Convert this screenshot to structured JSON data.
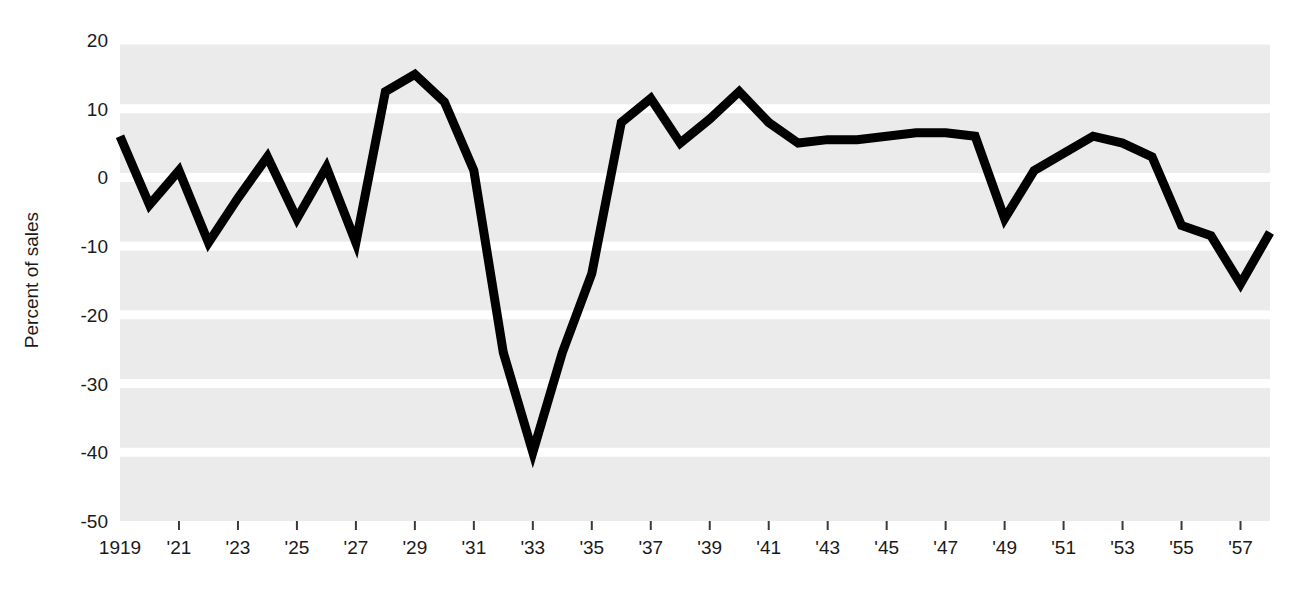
{
  "chart_data": {
    "type": "line",
    "title": "",
    "subtitle": "",
    "xlabel": "",
    "ylabel": "Percent of sales",
    "xlim": [
      1919,
      1958
    ],
    "ylim": [
      -50,
      20
    ],
    "grid": true,
    "legend": false,
    "legend_position": "none",
    "line_color": "#000000",
    "plot_background": "#ebebeb",
    "gridline_color": "#ffffff",
    "y_ticks": [
      20,
      10,
      0,
      -10,
      -20,
      -30,
      -40,
      -50
    ],
    "y_tick_labels": [
      "20",
      "10",
      "0",
      "-10",
      "-20",
      "-30",
      "-40",
      "-50"
    ],
    "x_ticks": [
      1919,
      1921,
      1923,
      1925,
      1927,
      1929,
      1931,
      1933,
      1935,
      1937,
      1939,
      1941,
      1943,
      1945,
      1947,
      1949,
      1951,
      1953,
      1955,
      1957
    ],
    "x_tick_labels": [
      "1919",
      "'21",
      "'23",
      "'25",
      "'27",
      "'29",
      "'31",
      "'33",
      "'35",
      "'37",
      "'39",
      "'41",
      "'43",
      "'45",
      "'47",
      "'49",
      "'51",
      "'53",
      "'55",
      "'57"
    ],
    "x": [
      1919,
      1920,
      1921,
      1922,
      1923,
      1924,
      1925,
      1926,
      1927,
      1928,
      1929,
      1930,
      1931,
      1932,
      1933,
      1934,
      1935,
      1936,
      1937,
      1938,
      1939,
      1940,
      1941,
      1942,
      1943,
      1944,
      1945,
      1946,
      1947,
      1948,
      1949,
      1950,
      1951,
      1952,
      1953,
      1954,
      1955,
      1956,
      1957,
      1958
    ],
    "series": [
      {
        "name": "Percent of sales",
        "values": [
          6,
          -4,
          1,
          -9.5,
          -3,
          3,
          -6,
          1.5,
          -9.5,
          12.5,
          15,
          11,
          1,
          -25.5,
          -40,
          -25.5,
          -14,
          8,
          11.5,
          5,
          8.5,
          12.5,
          8,
          5,
          5.5,
          5.5,
          6,
          6.5,
          6.5,
          6,
          -6,
          1,
          3.5,
          6,
          5,
          3,
          -7,
          -8.5,
          -15.5,
          -8
        ]
      }
    ]
  }
}
